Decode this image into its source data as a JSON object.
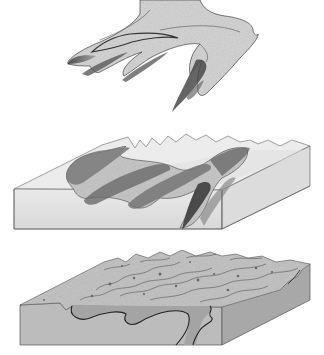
{
  "figure": {
    "panels": [
      {
        "id": "panel-1",
        "subject": "isolated-fold-surface"
      },
      {
        "id": "panel-2",
        "subject": "fold-in-transparent-block"
      },
      {
        "id": "panel-3",
        "subject": "eroded-terrain-block-with-fold-trace"
      }
    ],
    "colors": {
      "background": "#ffffff",
      "fold_fill": "#d6d6d6",
      "fold_shade": "#555555",
      "outline": "#333333",
      "block_top_glass": "#e4e4e4",
      "block_front_glass": "#dcdcdc",
      "block_side_glass": "#cfcfcf",
      "terrain_top": "#c4c4c4",
      "terrain_front": "#b9b9b9",
      "terrain_side": "#a6a6a6",
      "fold_band": "#a9a9a9"
    }
  }
}
